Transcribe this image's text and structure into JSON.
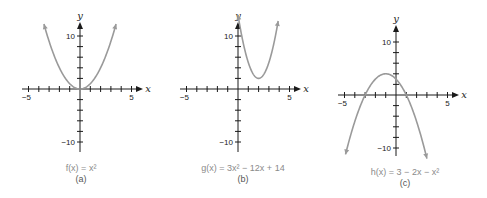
{
  "chart_data": [
    {
      "type": "line",
      "title": "f(x) = x²",
      "caption": "(a)",
      "xlabel": "x",
      "ylabel": "y",
      "xlim": [
        -5.5,
        5.5
      ],
      "ylim": [
        -11,
        12
      ],
      "x_ticks_labeled": [
        -5,
        5
      ],
      "y_ticks_labeled": [
        10,
        -10
      ],
      "function": "x^2",
      "domain": [
        -3.5,
        3.5
      ],
      "x": [
        -3.5,
        -3,
        -2,
        -1,
        0,
        1,
        2,
        3,
        3.5
      ],
      "y": [
        12.25,
        9,
        4,
        1,
        0,
        1,
        4,
        9,
        12.25
      ],
      "grid": false
    },
    {
      "type": "line",
      "title": "g(x) = 3x² − 12x + 14",
      "caption": "(b)",
      "xlabel": "x",
      "ylabel": "y",
      "xlim": [
        -5.5,
        5.5
      ],
      "ylim": [
        -11,
        12
      ],
      "x_ticks_labeled": [
        -5,
        5
      ],
      "y_ticks_labeled": [
        10,
        -10
      ],
      "function": "3x^2-12x+14",
      "domain": [
        0,
        3.9
      ],
      "x": [
        0,
        1,
        2,
        3,
        3.9
      ],
      "y": [
        14,
        5,
        2,
        5,
        12.8
      ],
      "vertex": [
        2,
        2
      ],
      "grid": false
    },
    {
      "type": "line",
      "title": "h(x) = 3 − 2x − x²",
      "caption": "(c)",
      "xlabel": "x",
      "ylabel": "y",
      "xlim": [
        -5.5,
        5.5
      ],
      "ylim": [
        -12,
        12
      ],
      "x_ticks_labeled": [
        -5,
        5
      ],
      "y_ticks_labeled": [
        10,
        -10
      ],
      "function": "3-2x-x^2",
      "domain": [
        -4.9,
        3.0
      ],
      "x": [
        -4.9,
        -3,
        -1,
        0,
        1,
        3
      ],
      "y": [
        -11.2,
        0,
        4,
        3,
        0,
        -12
      ],
      "vertex": [
        -1,
        4
      ],
      "grid": false
    }
  ],
  "panels": [
    {
      "caption_fn": "f(x) = x²",
      "caption_label": "(a)"
    },
    {
      "caption_fn": "g(x) = 3x² − 12x + 14",
      "caption_label": "(b)"
    },
    {
      "caption_fn": "h(x) = 3 − 2x − x²",
      "caption_label": "(c)"
    }
  ],
  "axis_labels": {
    "x": "x",
    "y": "y",
    "xmin": "−5",
    "xmax": "5",
    "ymax": "10",
    "ymin": "−10"
  }
}
